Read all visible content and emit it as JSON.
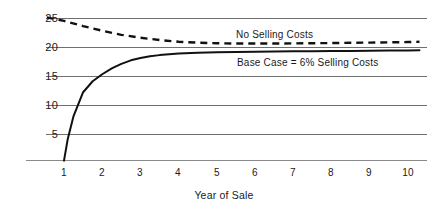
{
  "chart_data": {
    "type": "line",
    "title": "",
    "subtitle": "",
    "xlabel": "Year of Sale",
    "ylabel": "",
    "xlim": [
      0.5,
      10.4
    ],
    "ylim": [
      0,
      26
    ],
    "grid": true,
    "grid_axis": "y",
    "legend_position": "inline-annotation",
    "x_ticks": [
      1,
      2,
      3,
      4,
      5,
      6,
      7,
      8,
      9,
      10
    ],
    "x_tick_labels": [
      "1",
      "2",
      "3",
      "4",
      "5",
      "6",
      "7",
      "8",
      "9",
      "10"
    ],
    "y_ticks": [
      5,
      10,
      15,
      20,
      25
    ],
    "y_tick_labels": [
      "5",
      "10",
      "15",
      "20",
      "25"
    ],
    "series": [
      {
        "name": "No Selling Costs",
        "style": "dashed",
        "color": "#111111",
        "annotation": "No Selling Costs",
        "x": [
          0.55,
          1,
          1.5,
          2,
          2.5,
          3,
          3.5,
          4,
          4.5,
          5,
          5.5,
          6,
          6.5,
          7,
          7.5,
          8,
          8.5,
          9,
          9.5,
          10,
          10.3
        ],
        "values": [
          25.1,
          24.5,
          23.6,
          22.8,
          22.1,
          21.6,
          21.2,
          20.9,
          20.75,
          20.65,
          20.6,
          20.6,
          20.6,
          20.62,
          20.65,
          20.68,
          20.72,
          20.76,
          20.8,
          20.85,
          20.9
        ]
      },
      {
        "name": "Base Case = 6% Selling Costs",
        "style": "solid",
        "color": "#111111",
        "annotation": "Base Case  =  6% Selling Costs",
        "x": [
          1,
          1.1,
          1.25,
          1.5,
          1.75,
          2,
          2.25,
          2.5,
          2.75,
          3,
          3.25,
          3.5,
          4,
          4.5,
          5,
          5.5,
          6,
          6.5,
          7,
          7.5,
          8,
          8.5,
          9,
          9.5,
          10,
          10.3
        ],
        "values": [
          0.4,
          4.2,
          8.1,
          12.2,
          14.1,
          15.3,
          16.3,
          17.1,
          17.7,
          18.1,
          18.4,
          18.6,
          18.9,
          19.0,
          19.1,
          19.15,
          19.2,
          19.22,
          19.25,
          19.27,
          19.3,
          19.32,
          19.35,
          19.38,
          19.4,
          19.45
        ]
      }
    ]
  },
  "axis": {
    "x_title": "Year of Sale"
  },
  "annotations": {
    "no_selling_costs": "No Selling Costs",
    "base_case": "Base Case  =  6% Selling Costs"
  },
  "colors": {
    "line": "#111111",
    "gridline": "#6f6f6f",
    "axis": "#8a8a8a",
    "text": "#1a1a1a",
    "background": "#ffffff"
  }
}
